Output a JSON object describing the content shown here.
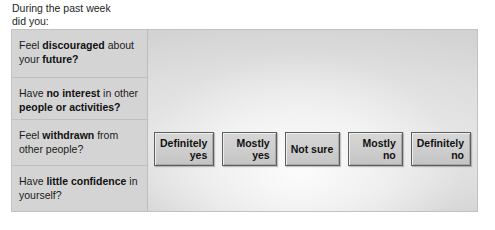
{
  "prompt": {
    "text": "During the past week\ndid you:"
  },
  "panel": {
    "questions": [
      {
        "id": "discouraged-future",
        "segments": [
          {
            "text": "Feel ",
            "bold": false
          },
          {
            "text": "discouraged",
            "bold": true
          },
          {
            "text": " about your ",
            "bold": false
          },
          {
            "text": "future?",
            "bold": true
          }
        ],
        "plain": "Feel discouraged about your future?"
      },
      {
        "id": "no-interest",
        "segments": [
          {
            "text": "Have ",
            "bold": false
          },
          {
            "text": "no interest",
            "bold": true
          },
          {
            "text": " in other ",
            "bold": false
          },
          {
            "text": "people or activities?",
            "bold": true
          }
        ],
        "plain": "Have no interest in other people or activities?"
      },
      {
        "id": "withdrawn",
        "segments": [
          {
            "text": "Feel ",
            "bold": false
          },
          {
            "text": "withdrawn",
            "bold": true
          },
          {
            "text": " from other people?",
            "bold": false
          }
        ],
        "plain": "Feel withdrawn from other people?"
      },
      {
        "id": "little-confidence",
        "segments": [
          {
            "text": "Have ",
            "bold": false
          },
          {
            "text": "little confidence",
            "bold": true
          },
          {
            "text": " in yourself?",
            "bold": false
          }
        ],
        "plain": "Have little confidence in yourself?"
      }
    ],
    "answers": [
      {
        "id": "definitely-yes",
        "lines": [
          "Definitely",
          "yes"
        ]
      },
      {
        "id": "mostly-yes",
        "lines": [
          "Mostly",
          "yes"
        ]
      },
      {
        "id": "not-sure",
        "lines": [
          "Not sure"
        ]
      },
      {
        "id": "mostly-no",
        "lines": [
          "Mostly",
          "no"
        ]
      },
      {
        "id": "definitely-no",
        "lines": [
          "Definitely",
          "no"
        ]
      }
    ]
  },
  "colors": {
    "page_background": "#ffffff",
    "panel_border": "#c2c2c2",
    "question_column": "#d4d4d4",
    "row_divider": "#bfbfbf",
    "answer_area_base": "#dcdcdc",
    "button_face": "#cfcfcf",
    "button_border": "#5e5e5e",
    "text": "#1b1b1b"
  }
}
